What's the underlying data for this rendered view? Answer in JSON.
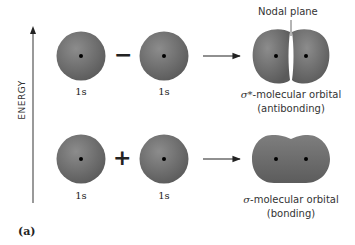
{
  "axis": {
    "label": "ENERGY"
  },
  "top_row": {
    "left_orbital": "1s",
    "right_orbital": "1s",
    "operator": "−",
    "result_label_symbol": "σ*",
    "result_label_text": "-molecular orbital",
    "result_type": "(antibonding)",
    "annotation": "Nodal plane"
  },
  "bottom_row": {
    "left_orbital": "1s",
    "right_orbital": "1s",
    "operator": "+",
    "result_label_symbol": "σ",
    "result_label_text": "-molecular orbital",
    "result_type": "(bonding)"
  },
  "panel_label": "(a)",
  "colors": {
    "orbital_fill_light": "#8a8a8a",
    "orbital_fill_dark": "#5e5e5e",
    "nucleus": "#000000",
    "arrow": "#222222"
  }
}
